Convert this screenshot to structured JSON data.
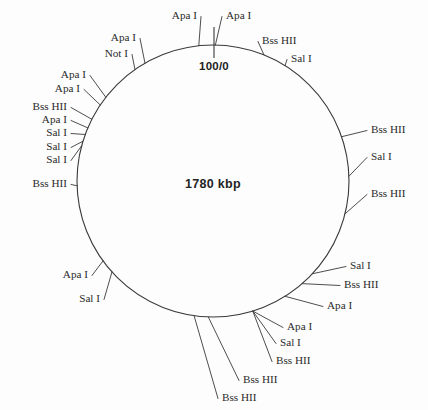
{
  "figure": {
    "type": "circular-restriction-map",
    "genome_size_label": "1780 kbp",
    "origin_label": "100/0",
    "circle": {
      "cx": 213,
      "cy": 181,
      "r": 136
    },
    "colors": {
      "background": "#fdfdfd",
      "line": "#3a3a3a",
      "text": "#2b2b2b"
    }
  },
  "chart_data": {
    "type": "circular-map",
    "title": "1780 kbp",
    "units": "kbp",
    "total": 1780,
    "scale_origin": "100/0",
    "enzymes": [
      "Apa I",
      "Bss HII",
      "Not I",
      "Sal I"
    ],
    "sites": [
      {
        "id": 1,
        "label": "Apa I",
        "angle_deg": -6,
        "label_x": 197,
        "label_y": 16,
        "anchor": "end"
      },
      {
        "id": 2,
        "label": "Apa I",
        "angle_deg": 1,
        "label_x": 226,
        "label_y": 16,
        "anchor": "start"
      },
      {
        "id": 3,
        "label": "Bss HII",
        "angle_deg": 22,
        "label_x": 262,
        "label_y": 41,
        "anchor": "start"
      },
      {
        "id": 4,
        "label": "Sal I",
        "angle_deg": 32,
        "label_x": 291,
        "label_y": 59,
        "anchor": "start"
      },
      {
        "id": 5,
        "label": "Bss HII",
        "angle_deg": 71,
        "label_x": 371,
        "label_y": 130,
        "anchor": "start"
      },
      {
        "id": 6,
        "label": "Sal I",
        "angle_deg": 88,
        "label_x": 371,
        "label_y": 157,
        "anchor": "start"
      },
      {
        "id": 7,
        "label": "Bss HII",
        "angle_deg": 104,
        "label_x": 371,
        "label_y": 194,
        "anchor": "start"
      },
      {
        "id": 8,
        "label": "Sal I",
        "angle_deg": 133,
        "label_x": 350,
        "label_y": 266,
        "anchor": "start"
      },
      {
        "id": 9,
        "label": "Bss HII",
        "angle_deg": 139,
        "label_x": 344,
        "label_y": 285,
        "anchor": "start"
      },
      {
        "id": 10,
        "label": "Apa I",
        "angle_deg": 148,
        "label_x": 327,
        "label_y": 306,
        "anchor": "start"
      },
      {
        "id": 11,
        "label": "Apa I",
        "angle_deg": 163,
        "label_x": 287,
        "label_y": 327,
        "anchor": "start"
      },
      {
        "id": 12,
        "label": "Sal I",
        "angle_deg": 163,
        "label_x": 280,
        "label_y": 343,
        "anchor": "start"
      },
      {
        "id": 13,
        "label": "Bss HII",
        "angle_deg": 163,
        "label_x": 276,
        "label_y": 361,
        "anchor": "start"
      },
      {
        "id": 14,
        "label": "Bss HII",
        "angle_deg": 182,
        "label_x": 243,
        "label_y": 380,
        "anchor": "start"
      },
      {
        "id": 15,
        "label": "Bss HII",
        "angle_deg": 188,
        "label_x": 222,
        "label_y": 398,
        "anchor": "start"
      },
      {
        "id": 16,
        "label": "Sal I",
        "angle_deg": 228,
        "label_x": 100,
        "label_y": 299,
        "anchor": "end"
      },
      {
        "id": 17,
        "label": "Apa I",
        "angle_deg": 234,
        "label_x": 88,
        "label_y": 275,
        "anchor": "end"
      },
      {
        "id": 18,
        "label": "Bss HII",
        "angle_deg": 268,
        "label_x": 67,
        "label_y": 184,
        "anchor": "end"
      },
      {
        "id": 19,
        "label": "Sal I",
        "angle_deg": 285,
        "label_x": 67,
        "label_y": 160,
        "anchor": "end"
      },
      {
        "id": 20,
        "label": "Sal I",
        "angle_deg": 287,
        "label_x": 67,
        "label_y": 147,
        "anchor": "end"
      },
      {
        "id": 21,
        "label": "Sal I",
        "angle_deg": 290,
        "label_x": 67,
        "label_y": 133,
        "anchor": "end"
      },
      {
        "id": 22,
        "label": "Apa I",
        "angle_deg": 293,
        "label_x": 67,
        "label_y": 120,
        "anchor": "end"
      },
      {
        "id": 23,
        "label": "Bss HII",
        "angle_deg": 297,
        "label_x": 67,
        "label_y": 107,
        "anchor": "end"
      },
      {
        "id": 24,
        "label": "Apa I",
        "angle_deg": 304,
        "label_x": 80,
        "label_y": 89,
        "anchor": "end"
      },
      {
        "id": 25,
        "label": "Apa I",
        "angle_deg": 308,
        "label_x": 86,
        "label_y": 75,
        "anchor": "end"
      },
      {
        "id": 26,
        "label": "Not I",
        "angle_deg": 325,
        "label_x": 128,
        "label_y": 54,
        "anchor": "end"
      },
      {
        "id": 27,
        "label": "Apa I",
        "angle_deg": 330,
        "label_x": 136,
        "label_y": 38,
        "anchor": "end"
      }
    ]
  }
}
